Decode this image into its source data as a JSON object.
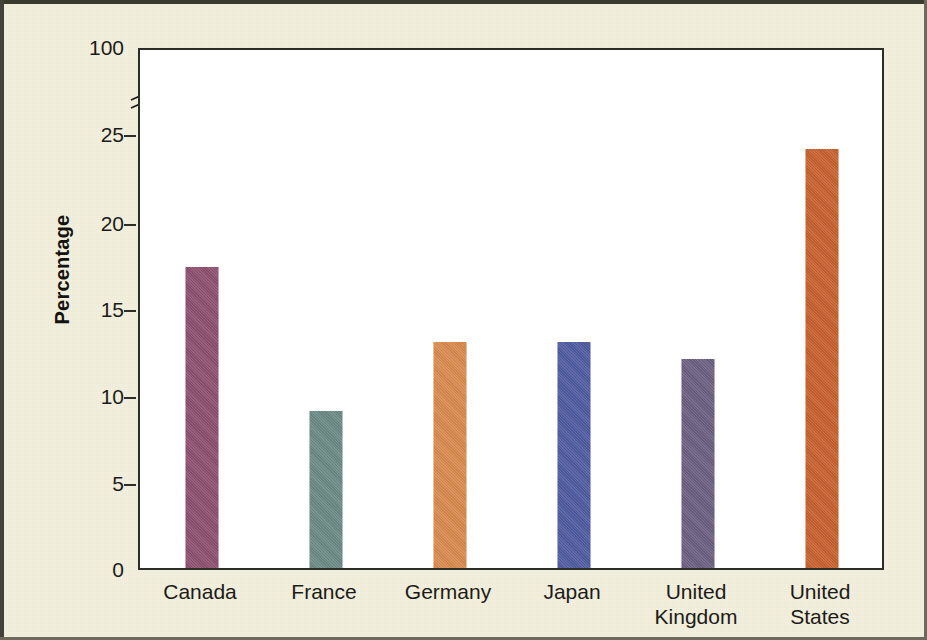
{
  "chart_data": {
    "type": "bar",
    "title": "",
    "subtitle": "",
    "xlabel": "",
    "ylabel": "Percentage",
    "categories": [
      "Canada",
      "France",
      "Germany",
      "Japan",
      "United Kingdom",
      "United States"
    ],
    "values": [
      17.3,
      9.0,
      13.0,
      13.0,
      12.0,
      24.1
    ],
    "bar_colors": [
      "#8d4f6e",
      "#6b8a85",
      "#d98a4f",
      "#4f5ba0",
      "#6b5f80",
      "#c8602e"
    ],
    "ylim": [
      0,
      100
    ],
    "y_ticks": [
      0,
      5,
      10,
      15,
      20,
      25,
      100
    ],
    "y_tick_labels": [
      "0",
      "5",
      "10",
      "15",
      "20",
      "25",
      "100"
    ],
    "axis_break": {
      "present": true,
      "between": [
        25,
        100
      ]
    },
    "grid": false,
    "legend": "none",
    "series": [
      {
        "name": "Percentage",
        "points": [
          {
            "category": "Canada",
            "value": 17.3,
            "color": "#8d4f6e"
          },
          {
            "category": "France",
            "value": 9.0,
            "color": "#6b8a85"
          },
          {
            "category": "Germany",
            "value": 13.0,
            "color": "#d98a4f"
          },
          {
            "category": "Japan",
            "value": 13.0,
            "color": "#4f5ba0"
          },
          {
            "category": "United Kingdom",
            "value": 12.0,
            "color": "#6b5f80"
          },
          {
            "category": "United States",
            "value": 24.1,
            "color": "#c8602e"
          }
        ]
      }
    ]
  },
  "axis": {
    "y_title": "Percentage",
    "y_labels": [
      "100",
      "25",
      "20",
      "15",
      "10",
      "5",
      "0"
    ],
    "x_labels": [
      {
        "line1": "Canada",
        "line2": ""
      },
      {
        "line1": "France",
        "line2": ""
      },
      {
        "line1": "Germany",
        "line2": ""
      },
      {
        "line1": "Japan",
        "line2": ""
      },
      {
        "line1": "United",
        "line2": "Kingdom"
      },
      {
        "line1": "United",
        "line2": "States"
      }
    ]
  },
  "style": {
    "page_background": "#f3f0dd",
    "plot_background": "#ffffff",
    "axis_color": "#2f2d28",
    "text_color": "#1d1b18",
    "frame_color": "#3a382f"
  }
}
